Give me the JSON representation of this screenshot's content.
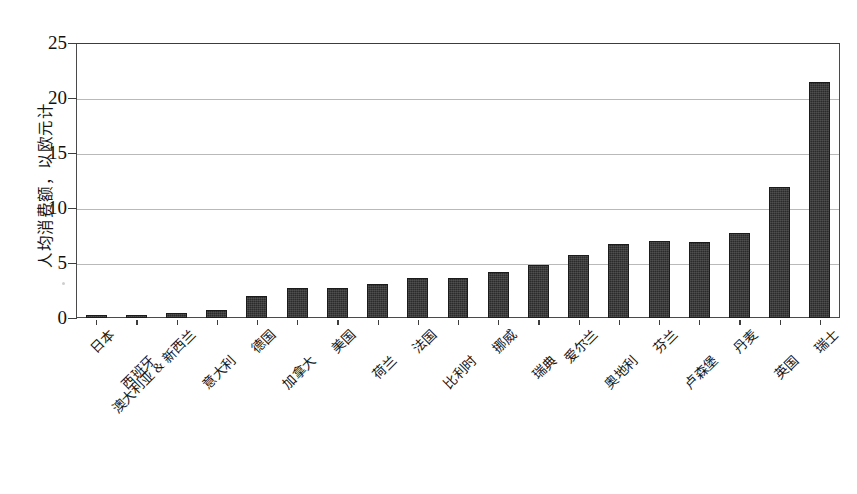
{
  "chart_data": {
    "type": "bar",
    "title": "",
    "xlabel": "",
    "ylabel": "人均消费额，以欧元计",
    "ylim": [
      0,
      25
    ],
    "yticks": [
      0,
      5,
      10,
      15,
      20,
      25
    ],
    "ytick_labels": [
      "0",
      "5",
      "10",
      "15",
      "20",
      "25"
    ],
    "grid": "horizontal",
    "legend": "none",
    "bar_color": "#2b2b2b",
    "categories": [
      "日本",
      "西班牙",
      "澳大利亚 & 新西兰",
      "意大利",
      "德国",
      "加拿大",
      "美国",
      "荷兰",
      "法国",
      "比利时",
      "挪威",
      "瑞典",
      "爱尔兰",
      "奥地利",
      "芬兰",
      "卢森堡",
      "丹麦",
      "英国",
      "瑞士"
    ],
    "values": [
      0.25,
      0.25,
      0.5,
      0.7,
      2.0,
      2.7,
      2.7,
      3.1,
      3.6,
      3.6,
      4.2,
      4.8,
      5.7,
      6.7,
      7.0,
      6.9,
      7.7,
      11.9,
      21.5
    ]
  }
}
